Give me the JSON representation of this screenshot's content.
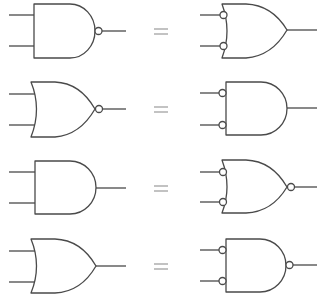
{
  "diagram": {
    "title": "De Morgan gate equivalences",
    "stroke_color": "#4a4a4a",
    "equals_color": "#9a9a9a",
    "equals_symbol": "=",
    "rows": [
      {
        "left": {
          "gate": "NAND",
          "inverted_inputs": false,
          "inverted_output": true
        },
        "right": {
          "gate": "OR",
          "inverted_inputs": true,
          "inverted_output": false
        },
        "relation": "="
      },
      {
        "left": {
          "gate": "NOR",
          "inverted_inputs": false,
          "inverted_output": true
        },
        "right": {
          "gate": "AND",
          "inverted_inputs": true,
          "inverted_output": false
        },
        "relation": "="
      },
      {
        "left": {
          "gate": "AND",
          "inverted_inputs": false,
          "inverted_output": false
        },
        "right": {
          "gate": "NOR",
          "inverted_inputs": true,
          "inverted_output": true
        },
        "relation": "="
      },
      {
        "left": {
          "gate": "OR",
          "inverted_inputs": false,
          "inverted_output": false
        },
        "right": {
          "gate": "NAND",
          "inverted_inputs": true,
          "inverted_output": true
        },
        "relation": "="
      }
    ]
  }
}
